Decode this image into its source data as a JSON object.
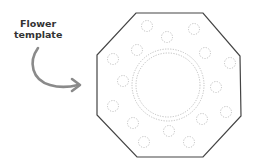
{
  "label": {
    "line1": "Flower",
    "line2": "template"
  },
  "colors": {
    "outline": "#444444",
    "dots": "#b8b8b8",
    "arrow": "#8a8a8a",
    "text": "#333333"
  },
  "shape": {
    "type": "octagon",
    "points": "136,13 203,13 240,56 241,116 203,157 137,157 97,115 97,55"
  },
  "center_circle": {
    "cx": 168,
    "cy": 85,
    "r_outer": 36,
    "r_inner": 32
  },
  "small_circles": [
    {
      "cx": 147,
      "cy": 26
    },
    {
      "cx": 167,
      "cy": 37
    },
    {
      "cx": 194,
      "cy": 29
    },
    {
      "cx": 137,
      "cy": 50
    },
    {
      "cx": 113,
      "cy": 59
    },
    {
      "cx": 205,
      "cy": 53
    },
    {
      "cx": 230,
      "cy": 63
    },
    {
      "cx": 123,
      "cy": 81
    },
    {
      "cx": 216,
      "cy": 87
    },
    {
      "cx": 113,
      "cy": 106
    },
    {
      "cx": 226,
      "cy": 112
    },
    {
      "cx": 133,
      "cy": 123
    },
    {
      "cx": 202,
      "cy": 119
    },
    {
      "cx": 169,
      "cy": 131
    },
    {
      "cx": 144,
      "cy": 142
    },
    {
      "cx": 189,
      "cy": 142
    }
  ]
}
